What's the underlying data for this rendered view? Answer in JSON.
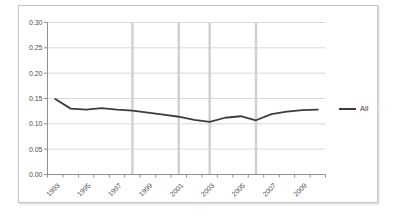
{
  "chart_style": {
    "background": "#ffffff",
    "border_color": "#c7c7c7",
    "axis_color": "#8f8f8f",
    "gridline_color": "#d9d9d9",
    "band_color": "#d1d1d1",
    "series_color": "#3d3d3d",
    "label_color": "#4d4d4d"
  },
  "legend": {
    "position": "right",
    "items": [
      {
        "label": "All",
        "color": "#3d3d3d"
      }
    ]
  },
  "chart_data": {
    "type": "line",
    "title": "",
    "xlabel": "",
    "ylabel": "",
    "x": [
      1993,
      1994,
      1995,
      1996,
      1997,
      1998,
      1999,
      2000,
      2001,
      2002,
      2003,
      2004,
      2005,
      2006,
      2007,
      2008,
      2009,
      2010
    ],
    "series": [
      {
        "name": "All",
        "values": [
          0.149,
          0.13,
          0.128,
          0.131,
          0.128,
          0.126,
          0.122,
          0.118,
          0.114,
          0.108,
          0.104,
          0.112,
          0.115,
          0.107,
          0.119,
          0.124,
          0.127,
          0.128
        ]
      }
    ],
    "ylim": [
      0,
      0.3
    ],
    "ytick_step": 0.05,
    "ytick_labels": [
      "0.00",
      "0.05",
      "0.10",
      "0.15",
      "0.20",
      "0.25",
      "0.30"
    ],
    "xtick_labels": [
      "1993",
      "1995",
      "1997",
      "1999",
      "2001",
      "2003",
      "2005",
      "2007",
      "2009"
    ],
    "vertical_gridline_years": [
      1998,
      2001,
      2003,
      2006
    ],
    "grid": "horizontal",
    "legend_position": "right"
  }
}
